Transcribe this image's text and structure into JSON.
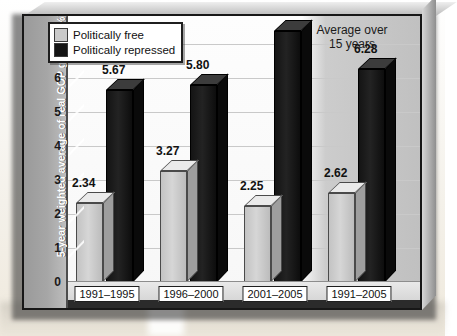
{
  "chart_data": {
    "type": "bar",
    "title": "",
    "subtitle": "",
    "xlabel": "",
    "ylabel": "5-year weighted average of real GOP growth (%)",
    "ylim": [
      0,
      7.6
    ],
    "yticks": [
      0,
      1,
      2,
      3,
      4,
      5,
      6,
      7
    ],
    "ytick_labels": [
      "0",
      "1",
      "2",
      "3",
      "4",
      "5",
      "6",
      "7"
    ],
    "grid": true,
    "legend_position": "top-left",
    "categories": [
      "1991–1995",
      "1996–2000",
      "2001–2005",
      "1991–2005"
    ],
    "series": [
      {
        "name": "Politically free",
        "color": "#c9c9c9",
        "values": [
          2.34,
          3.27,
          2.25,
          2.62
        ],
        "labels": [
          "2.34",
          "3.27",
          "2.25",
          "2.62"
        ]
      },
      {
        "name": "Politically repressed",
        "color": "#141414",
        "values": [
          5.67,
          5.8,
          7.38,
          6.28
        ],
        "labels": [
          "5.67",
          "5.80",
          "7.38",
          "6.28"
        ]
      }
    ],
    "annotations": [
      {
        "text": "Average over 15 years",
        "target_category": "1991–2005",
        "position": "top-right"
      }
    ]
  },
  "legend": {
    "items": [
      {
        "label": "Politically free",
        "swatch": "light-grey-swatch"
      },
      {
        "label": "Politically repressed",
        "swatch": "dark-swatch"
      }
    ]
  },
  "annotation": {
    "line1": "Average over",
    "line2": "15 years"
  },
  "axis": {
    "y_title": "5-year weighted average of real GOP growth (%)",
    "y_ticks": [
      "7",
      "6",
      "5",
      "4",
      "3",
      "2",
      "1",
      "0"
    ]
  },
  "categories": [
    {
      "label": "1991–1995"
    },
    {
      "label": "1996–2000"
    },
    {
      "label": "2001–2005"
    },
    {
      "label": "1991–2005"
    }
  ],
  "bar_labels": {
    "g0_free": "2.34",
    "g0_rep": "5.67",
    "g1_free": "3.27",
    "g1_rep": "5.80",
    "g2_free": "2.25",
    "g2_rep": "7.38",
    "g3_free": "2.62",
    "g3_rep": "6.28"
  },
  "colors": {
    "free": "#c9c9c9",
    "repressed": "#141414",
    "panel": "#ffffff",
    "axis_band": "#a6a6a6"
  }
}
